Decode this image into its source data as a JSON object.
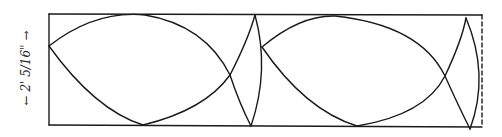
{
  "figure": {
    "dimension_label": "← 2' 5/16\" →",
    "stroke_color": "#1a1a1a",
    "background": "#ffffff",
    "frame": {
      "x": 49,
      "y": 14,
      "width": 433,
      "height": 111,
      "right_edge_style": "dashed"
    }
  }
}
